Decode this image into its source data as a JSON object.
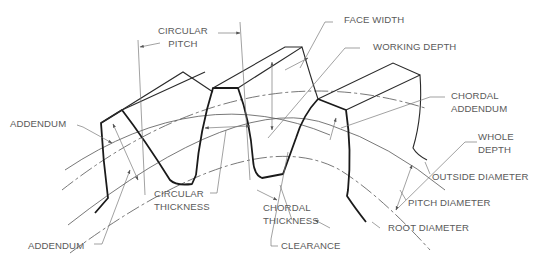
{
  "diagram": {
    "labels": {
      "circular_pitch": [
        "CIRCULAR",
        "PITCH"
      ],
      "face_width": "FACE WIDTH",
      "working_depth": "WORKING DEPTH",
      "chordal_addendum": [
        "CHORDAL",
        "ADDENDUM"
      ],
      "addendum_top": "ADDENDUM",
      "whole_depth": [
        "WHOLE",
        "DEPTH"
      ],
      "outside_diameter": "OUTSIDE DIAMETER",
      "pitch_diameter": "PITCH DIAMETER",
      "circular_thickness": [
        "CIRCULAR",
        "THICKNESS"
      ],
      "chordal_thickness": [
        "CHORDAL",
        "THICKNESS"
      ],
      "root_diameter": "ROOT DIAMETER",
      "addendum_bottom": "ADDENDUM",
      "clearance": "CLEARANCE"
    },
    "colors": {
      "outline": "#1a1a1a",
      "leader": "#7a7a7a",
      "text": "#5a5a5a",
      "background": "#ffffff"
    }
  }
}
